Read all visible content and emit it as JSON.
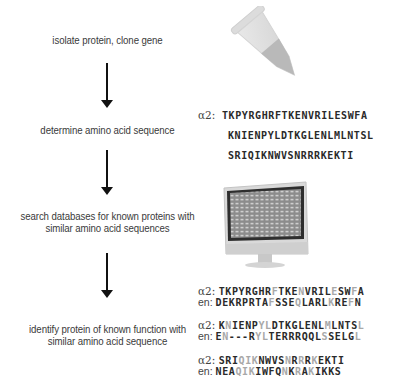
{
  "steps": [
    {
      "label": "isolate protein, clone gene"
    },
    {
      "label": "determine amino acid sequence"
    },
    {
      "label_line1": "search databases for known proteins with",
      "label_line2": "similar amino acid sequences"
    },
    {
      "label_line1": "identify protein of known function with",
      "label_line2": "similar amino acid sequence"
    }
  ],
  "illustrations": {
    "tube": "microcentrifuge-tube",
    "computer": "desktop-monitor"
  },
  "sequence": {
    "label": "α2:",
    "lines": [
      "TKPYRGHRFTKENVRILESWFA",
      "KNIENPYLDTKGLENLMLNTSL",
      "SRIQIKNWVSNRRRKEKTI"
    ]
  },
  "alignment": {
    "query_label": "α2:",
    "match_label": "en:",
    "match_color": "#a8a8a8",
    "blocks": [
      {
        "query": "TKPYRGHRFTKENVRILESWFA",
        "match": "DEKRPRTAFSSEQLARLKREFN",
        "gray_positions": [
          8,
          12,
          17,
          20
        ]
      },
      {
        "query": "KNIENPYLDTKGLENLMLNTSL",
        "match": "EN---RYLTERRRQQLSSELGL",
        "gray_positions": [
          1,
          6,
          7,
          16,
          21
        ]
      },
      {
        "query": "SRIQIKNWVSNRRRKEKTI",
        "match": "NEAQIKIWFQNKRAKIKKS",
        "gray_positions": [
          3,
          4,
          5,
          10,
          12,
          14
        ]
      }
    ]
  }
}
